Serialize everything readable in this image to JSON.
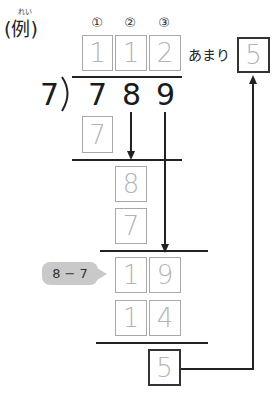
{
  "example": {
    "label": "(例)",
    "ruby": "れい"
  },
  "place_markers": [
    "①",
    "②",
    "③"
  ],
  "quotient": [
    "1",
    "1",
    "2"
  ],
  "remainder_label": "あまり",
  "remainder_value": "5",
  "divisor": "7",
  "dividend": [
    "7",
    "8",
    "9"
  ],
  "steps": {
    "first_product": "7",
    "first_diff": "8",
    "second_product": "7",
    "bring_down_row": [
      "1",
      "9"
    ],
    "third_product_row": [
      "1",
      "4"
    ],
    "final_remainder": "5"
  },
  "hint_bubble": "8 − 7",
  "colors": {
    "box_border": "#a8a8a8",
    "box_text": "#b4b4b4",
    "line": "#222222",
    "bubble": "#c9c9c9"
  }
}
